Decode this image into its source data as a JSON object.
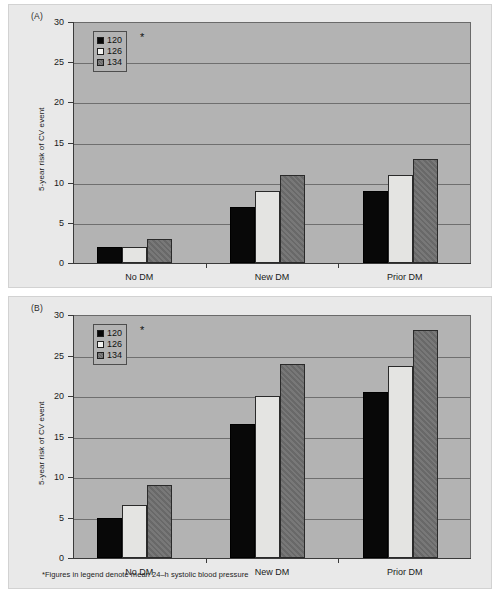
{
  "figure": {
    "background": "#ffffff",
    "panel_background": "#e9e9e9",
    "plot_background": "#b3b3b3",
    "footnote": "*Figures in legend denote mean 24–h systolic blood pressure"
  },
  "panels": [
    {
      "label": "(A)"
    },
    {
      "label": "(B)"
    }
  ],
  "legend": {
    "asterisk": "*",
    "items": [
      {
        "label": "120",
        "color": "#080808",
        "key": "s120"
      },
      {
        "label": "126",
        "color": "#f2f2f0",
        "key": "s126"
      },
      {
        "label": "134",
        "color": "#6e6e6e",
        "key": "s134"
      }
    ]
  },
  "axis": {
    "y_label": "5-year risk of CV event",
    "y_ticks": [
      "0",
      "5",
      "10",
      "15",
      "20",
      "25",
      "30"
    ],
    "x_ticks": [
      "No DM",
      "New DM",
      "Prior DM"
    ]
  },
  "chart_data": [
    {
      "type": "bar",
      "panel": "(A)",
      "title": "",
      "xlabel": "",
      "ylabel": "5-year risk of CV event",
      "ylim": [
        0,
        30
      ],
      "ytick_values": [
        0,
        5,
        10,
        15,
        20,
        25,
        30
      ],
      "grid": true,
      "legend_position": "upper-left",
      "legend_note": "Figures in legend denote mean 24-h systolic blood pressure",
      "categories": [
        "No DM",
        "New DM",
        "Prior DM"
      ],
      "series": [
        {
          "name": "120",
          "values": [
            2,
            7,
            9
          ]
        },
        {
          "name": "126",
          "values": [
            2,
            9,
            11
          ]
        },
        {
          "name": "134",
          "values": [
            3,
            11,
            13
          ]
        }
      ]
    },
    {
      "type": "bar",
      "panel": "(B)",
      "title": "",
      "xlabel": "",
      "ylabel": "5-year risk of CV event",
      "ylim": [
        0,
        30
      ],
      "ytick_values": [
        0,
        5,
        10,
        15,
        20,
        25,
        30
      ],
      "grid": true,
      "legend_position": "upper-left",
      "legend_note": "Figures in legend denote mean 24-h systolic blood pressure",
      "categories": [
        "No DM",
        "New DM",
        "Prior DM"
      ],
      "series": [
        {
          "name": "120",
          "values": [
            5,
            16.5,
            20.5
          ]
        },
        {
          "name": "126",
          "values": [
            6.5,
            20,
            23.7
          ]
        },
        {
          "name": "134",
          "values": [
            9,
            24,
            28.2
          ]
        }
      ]
    }
  ]
}
